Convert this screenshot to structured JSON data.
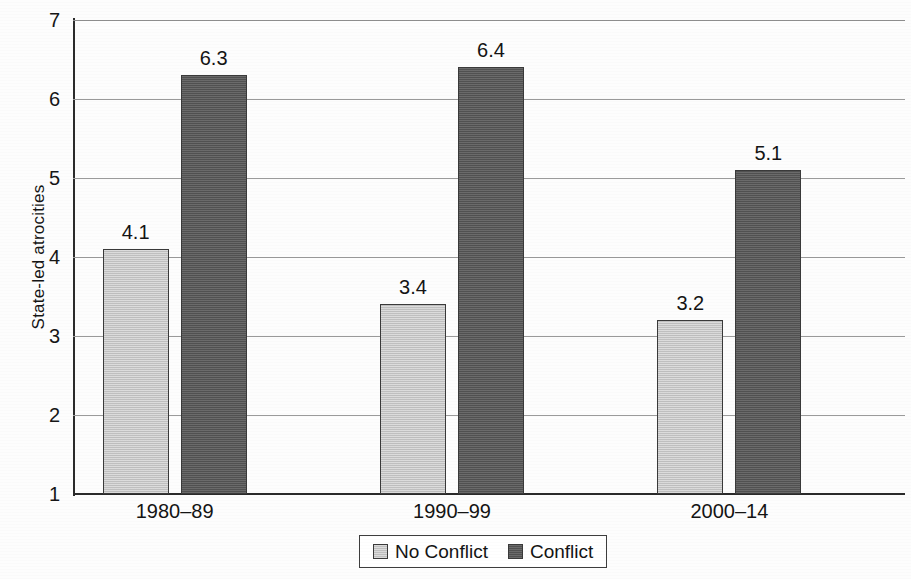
{
  "chart_data": {
    "type": "bar",
    "title": "",
    "subtitle": "",
    "xlabel": "",
    "ylabel": "State-led atrocities",
    "categories": [
      "1980–89",
      "1990–99",
      "2000–14"
    ],
    "series": [
      {
        "name": "No Conflict",
        "values": [
          4.1,
          3.4,
          3.2
        ],
        "color": "#c9c9c9"
      },
      {
        "name": "Conflict",
        "values": [
          6.3,
          6.4,
          5.1
        ],
        "color": "#5a5a5a"
      }
    ],
    "value_labels": [
      [
        "4.1",
        "3.4",
        "3.2"
      ],
      [
        "6.3",
        "6.4",
        "5.1"
      ]
    ],
    "ylim": [
      1,
      7
    ],
    "ytick_labels": [
      "1",
      "2",
      "3",
      "4",
      "5",
      "6",
      "7"
    ],
    "ytick_values": [
      1,
      2,
      3,
      4,
      5,
      6,
      7
    ],
    "bar_baseline": 1,
    "grid": true,
    "grid_axis": "y",
    "legend_position": "bottom-center",
    "legend_entries": [
      "No Conflict",
      "Conflict"
    ]
  },
  "axis": {
    "y_title": "State-led atrocities"
  },
  "legend": {
    "entries": [
      {
        "label": "No Conflict"
      },
      {
        "label": "Conflict"
      }
    ]
  }
}
